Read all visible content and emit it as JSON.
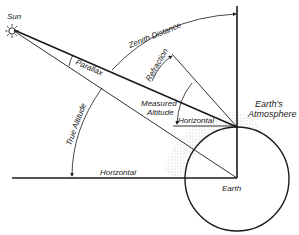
{
  "diagram": {
    "type": "astronomical-geometry",
    "labels": {
      "sun": "Sun",
      "zenith_distance": "Zenith Distance",
      "parallax": "Parallax",
      "refraction": "Refraction",
      "measured_altitude": "Measured Altitude",
      "measured_altitude_line1": "Measured",
      "measured_altitude_line2": "Altitude",
      "horizontal_observer": "Horizontal",
      "earths_atmosphere_line1": "Earth's",
      "earths_atmosphere_line2": "Atmosphere",
      "true_altitude": "True Altitude",
      "horizontal_center": "Horizontal",
      "earth": "Earth"
    },
    "colors": {
      "ink": "#1a1a1a",
      "background": "#ffffff",
      "stipple": "#8a8a8a"
    }
  }
}
